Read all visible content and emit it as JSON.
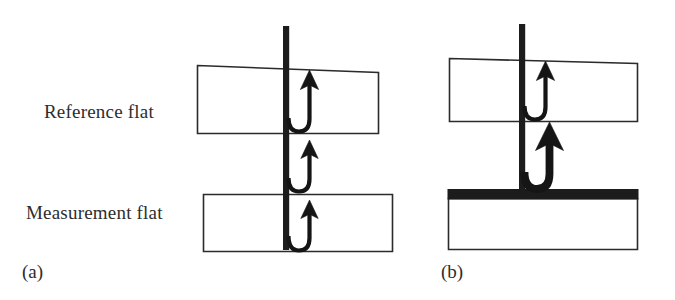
{
  "figure": {
    "background_color": "#ffffff",
    "ink_color": "#1c1c1c",
    "outline_color": "#2b2b2b",
    "width": 675,
    "height": 300
  },
  "labels": {
    "reference_flat": "Reference flat",
    "measurement_flat": "Measurement flat",
    "panel_a": "(a)",
    "panel_b": "(b)"
  },
  "panels": [
    {
      "id": "a",
      "tag": "(a)",
      "description": "Uncoated measurement flat: beam passes through and reflects from three surfaces",
      "elements": [
        {
          "name": "reference-flat-block",
          "kind": "tilted-rectangle",
          "fill": "#ffffff",
          "stroke": "#2b2b2b"
        },
        {
          "name": "measurement-flat-block",
          "kind": "rectangle",
          "fill": "#ffffff",
          "stroke": "#2b2b2b"
        },
        {
          "name": "incident-beam",
          "kind": "vertical-beam",
          "fill": "#1c1c1c"
        },
        {
          "name": "reflection-arrow-1",
          "kind": "u-turn-arrow",
          "weight": "thin"
        },
        {
          "name": "reflection-arrow-2",
          "kind": "u-turn-arrow",
          "weight": "thin"
        },
        {
          "name": "reflection-arrow-3",
          "kind": "u-turn-arrow",
          "weight": "thin"
        }
      ]
    },
    {
      "id": "b",
      "tag": "(b)",
      "description": "Coated measurement flat: strong single reflection from the opaque coating",
      "elements": [
        {
          "name": "reference-flat-block",
          "kind": "tilted-rectangle",
          "fill": "#ffffff",
          "stroke": "#2b2b2b"
        },
        {
          "name": "coating-layer",
          "kind": "solid-bar",
          "fill": "#1c1c1c"
        },
        {
          "name": "measurement-flat-block",
          "kind": "rectangle",
          "fill": "#ffffff",
          "stroke": "#2b2b2b"
        },
        {
          "name": "incident-beam",
          "kind": "vertical-beam",
          "fill": "#1c1c1c"
        },
        {
          "name": "reflection-arrow-1",
          "kind": "u-turn-arrow",
          "weight": "thin"
        },
        {
          "name": "reflection-arrow-2",
          "kind": "u-turn-arrow",
          "weight": "bold"
        }
      ]
    }
  ]
}
